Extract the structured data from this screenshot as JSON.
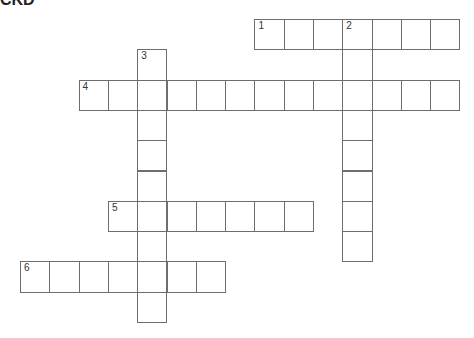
{
  "title": "CKD",
  "grid": {
    "origin_x": 20,
    "origin_y": 19,
    "cell_w": 29.3,
    "cell_h": 30.3
  },
  "entries": [
    {
      "number": "1",
      "direction": "across",
      "row": 0,
      "col": 8,
      "length": 7
    },
    {
      "number": "2",
      "direction": "down",
      "row": 0,
      "col": 11,
      "length": 8
    },
    {
      "number": "3",
      "direction": "down",
      "row": 1,
      "col": 4,
      "length": 9
    },
    {
      "number": "4",
      "direction": "across",
      "row": 2,
      "col": 2,
      "length": 13
    },
    {
      "number": "5",
      "direction": "across",
      "row": 6,
      "col": 3,
      "length": 7
    },
    {
      "number": "6",
      "direction": "across",
      "row": 8,
      "col": 0,
      "length": 7
    }
  ]
}
